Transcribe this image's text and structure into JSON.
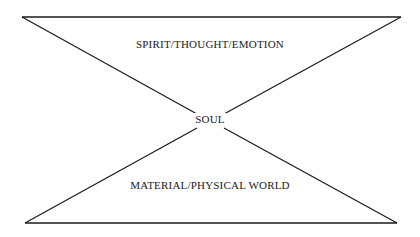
{
  "diagram": {
    "type": "hourglass",
    "labels": {
      "top": "SPIRIT/THOUGHT/EMOTION",
      "center": "SOUL",
      "bottom": "MATERIAL/PHYSICAL WORLD"
    },
    "colors": {
      "line": "#1a1a1a",
      "background": "#ffffff",
      "text": "#1a1a1a"
    }
  }
}
